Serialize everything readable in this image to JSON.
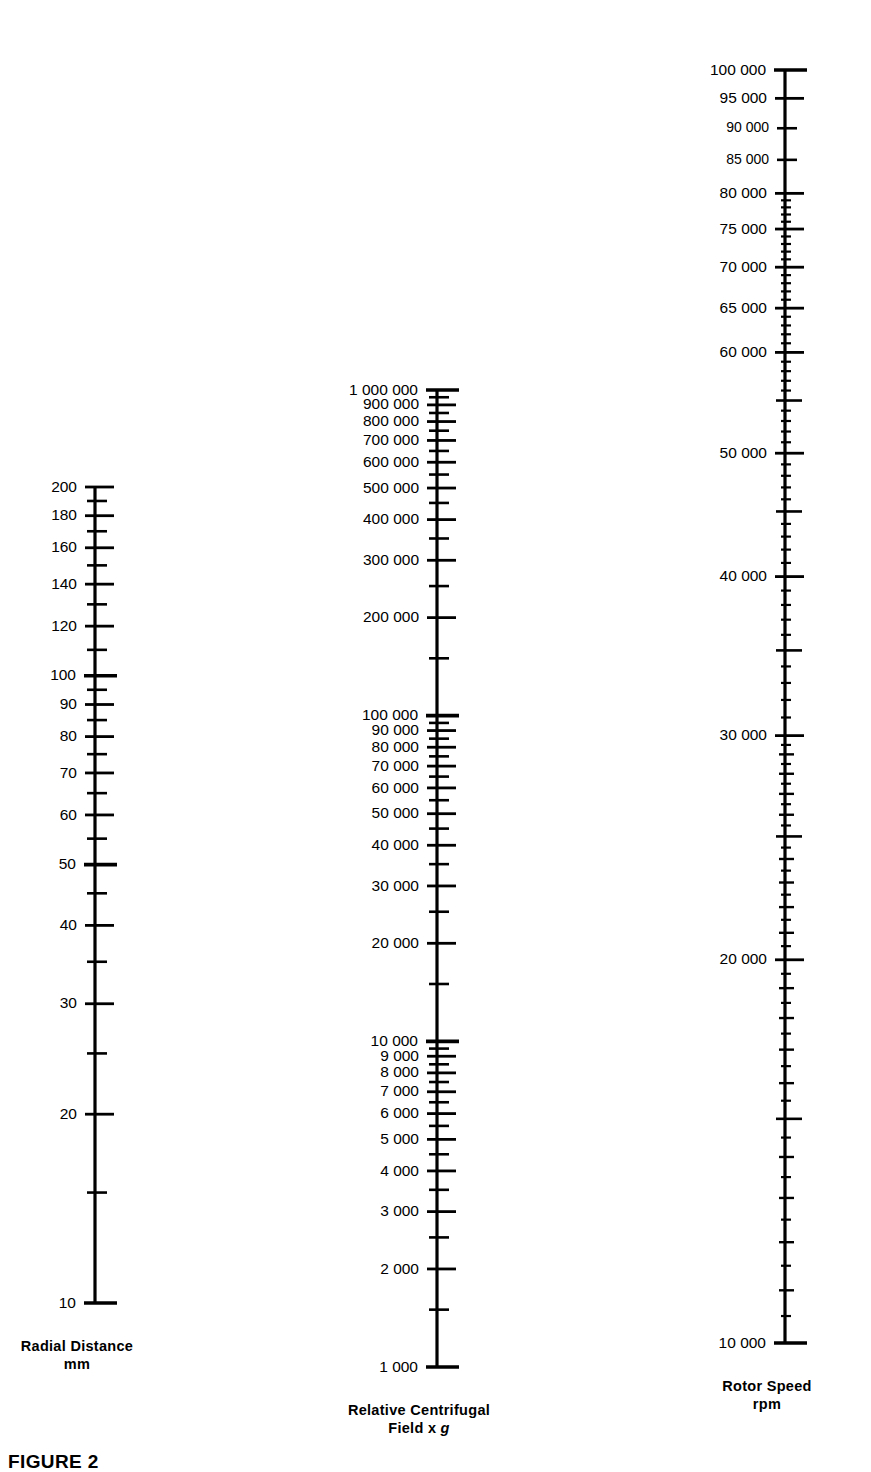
{
  "figure": {
    "caption": "FIGURE 2",
    "background": "#ffffff",
    "ink": "#000000"
  },
  "chart_data": {
    "type": "nomogram",
    "title": "",
    "grid": false,
    "legend": null,
    "axes": [
      {
        "id": "radial-distance",
        "title_line1": "Radial Distance",
        "title_line2": "mm",
        "unit": "mm",
        "scale": "log",
        "range": [
          10,
          200
        ],
        "x": 95,
        "y_top": 487,
        "y_bottom": 1303,
        "labels_side": "left",
        "ticks": [
          {
            "v": 200,
            "label": "200",
            "size": "major"
          },
          {
            "v": 190,
            "label": "",
            "size": "minor"
          },
          {
            "v": 180,
            "label": "180",
            "size": "major"
          },
          {
            "v": 170,
            "label": "",
            "size": "minor"
          },
          {
            "v": 160,
            "label": "160",
            "size": "major"
          },
          {
            "v": 150,
            "label": "",
            "size": "minor"
          },
          {
            "v": 140,
            "label": "140",
            "size": "major"
          },
          {
            "v": 130,
            "label": "",
            "size": "minor"
          },
          {
            "v": 120,
            "label": "120",
            "size": "major"
          },
          {
            "v": 110,
            "label": "",
            "size": "minor"
          },
          {
            "v": 100,
            "label": "100",
            "size": "decade"
          },
          {
            "v": 95,
            "label": "",
            "size": "minor"
          },
          {
            "v": 90,
            "label": "90",
            "size": "major"
          },
          {
            "v": 85,
            "label": "",
            "size": "minor"
          },
          {
            "v": 80,
            "label": "80",
            "size": "major"
          },
          {
            "v": 75,
            "label": "",
            "size": "minor"
          },
          {
            "v": 70,
            "label": "70",
            "size": "major"
          },
          {
            "v": 65,
            "label": "",
            "size": "minor"
          },
          {
            "v": 60,
            "label": "60",
            "size": "major"
          },
          {
            "v": 55,
            "label": "",
            "size": "minor"
          },
          {
            "v": 50,
            "label": "50",
            "size": "decade"
          },
          {
            "v": 45,
            "label": "",
            "size": "minor"
          },
          {
            "v": 40,
            "label": "40",
            "size": "major"
          },
          {
            "v": 35,
            "label": "",
            "size": "minor"
          },
          {
            "v": 30,
            "label": "30",
            "size": "major"
          },
          {
            "v": 25,
            "label": "",
            "size": "minor"
          },
          {
            "v": 20,
            "label": "20",
            "size": "major"
          },
          {
            "v": 15,
            "label": "",
            "size": "minor"
          },
          {
            "v": 10,
            "label": "10",
            "size": "decade"
          }
        ]
      },
      {
        "id": "relative-centrifugal-field",
        "title_line1": "Relative Centrifugal",
        "title_line2_pre": "Field x ",
        "title_line2_italic": "g",
        "unit": "x g",
        "scale": "log",
        "range": [
          1000,
          1000000
        ],
        "x": 437,
        "y_top": 390,
        "y_bottom": 1367,
        "labels_side": "left",
        "ticks": [
          {
            "v": 1000000,
            "label": "1 000 000",
            "size": "decade"
          },
          {
            "v": 950000,
            "label": "",
            "size": "minor"
          },
          {
            "v": 900000,
            "label": "900 000",
            "size": "major"
          },
          {
            "v": 850000,
            "label": "",
            "size": "minor"
          },
          {
            "v": 800000,
            "label": "800 000",
            "size": "major"
          },
          {
            "v": 750000,
            "label": "",
            "size": "minor"
          },
          {
            "v": 700000,
            "label": "700 000",
            "size": "major"
          },
          {
            "v": 650000,
            "label": "",
            "size": "minor"
          },
          {
            "v": 600000,
            "label": "600 000",
            "size": "major"
          },
          {
            "v": 550000,
            "label": "",
            "size": "minor"
          },
          {
            "v": 500000,
            "label": "500 000",
            "size": "major"
          },
          {
            "v": 450000,
            "label": "",
            "size": "minor"
          },
          {
            "v": 400000,
            "label": "400 000",
            "size": "major"
          },
          {
            "v": 350000,
            "label": "",
            "size": "minor"
          },
          {
            "v": 300000,
            "label": "300 000",
            "size": "major"
          },
          {
            "v": 250000,
            "label": "",
            "size": "minor"
          },
          {
            "v": 200000,
            "label": "200 000",
            "size": "major"
          },
          {
            "v": 150000,
            "label": "",
            "size": "minor"
          },
          {
            "v": 100000,
            "label": "100 000",
            "size": "decade"
          },
          {
            "v": 95000,
            "label": "",
            "size": "minor"
          },
          {
            "v": 90000,
            "label": "90 000",
            "size": "major"
          },
          {
            "v": 85000,
            "label": "",
            "size": "minor"
          },
          {
            "v": 80000,
            "label": "80 000",
            "size": "major"
          },
          {
            "v": 75000,
            "label": "",
            "size": "minor"
          },
          {
            "v": 70000,
            "label": "70 000",
            "size": "major"
          },
          {
            "v": 65000,
            "label": "",
            "size": "minor"
          },
          {
            "v": 60000,
            "label": "60 000",
            "size": "major"
          },
          {
            "v": 55000,
            "label": "",
            "size": "minor"
          },
          {
            "v": 50000,
            "label": "50 000",
            "size": "major"
          },
          {
            "v": 45000,
            "label": "",
            "size": "minor"
          },
          {
            "v": 40000,
            "label": "40 000",
            "size": "major"
          },
          {
            "v": 35000,
            "label": "",
            "size": "minor"
          },
          {
            "v": 30000,
            "label": "30 000",
            "size": "major"
          },
          {
            "v": 25000,
            "label": "",
            "size": "minor"
          },
          {
            "v": 20000,
            "label": "20 000",
            "size": "major"
          },
          {
            "v": 15000,
            "label": "",
            "size": "minor"
          },
          {
            "v": 10000,
            "label": "10 000",
            "size": "decade"
          },
          {
            "v": 9500,
            "label": "",
            "size": "minor"
          },
          {
            "v": 9000,
            "label": "9 000",
            "size": "major"
          },
          {
            "v": 8500,
            "label": "",
            "size": "minor"
          },
          {
            "v": 8000,
            "label": "8 000",
            "size": "major"
          },
          {
            "v": 7500,
            "label": "",
            "size": "minor"
          },
          {
            "v": 7000,
            "label": "7 000",
            "size": "major"
          },
          {
            "v": 6500,
            "label": "",
            "size": "minor"
          },
          {
            "v": 6000,
            "label": "6 000",
            "size": "major"
          },
          {
            "v": 5500,
            "label": "",
            "size": "minor"
          },
          {
            "v": 5000,
            "label": "5 000",
            "size": "major"
          },
          {
            "v": 4500,
            "label": "",
            "size": "minor"
          },
          {
            "v": 4000,
            "label": "4 000",
            "size": "major"
          },
          {
            "v": 3500,
            "label": "",
            "size": "minor"
          },
          {
            "v": 3000,
            "label": "3 000",
            "size": "major"
          },
          {
            "v": 2500,
            "label": "",
            "size": "minor"
          },
          {
            "v": 2000,
            "label": "2 000",
            "size": "major"
          },
          {
            "v": 1500,
            "label": "",
            "size": "minor"
          },
          {
            "v": 1000,
            "label": "1 000",
            "size": "decade"
          }
        ]
      },
      {
        "id": "rotor-speed",
        "title_line1": "Rotor Speed",
        "title_line2": "rpm",
        "unit": "rpm",
        "scale": "log",
        "range": [
          10000,
          100000
        ],
        "x": 785,
        "y_top": 70,
        "y_bottom": 1343,
        "labels_side": "left",
        "ticks": [
          {
            "v": 100000,
            "label": "100 000",
            "size": "decade"
          },
          {
            "v": 95000,
            "label": "95 000",
            "size": "major"
          },
          {
            "v": 90000,
            "label": "90 000",
            "size": "minor"
          },
          {
            "v": 85000,
            "label": "85 000",
            "size": "minor"
          },
          {
            "v": 80000,
            "label": "80 000",
            "size": "major"
          },
          {
            "v": 79000,
            "label": "",
            "size": "tiny"
          },
          {
            "v": 78000,
            "label": "",
            "size": "tiny"
          },
          {
            "v": 77000,
            "label": "",
            "size": "tiny"
          },
          {
            "v": 76000,
            "label": "",
            "size": "tiny"
          },
          {
            "v": 75000,
            "label": "75 000",
            "size": "major"
          },
          {
            "v": 74000,
            "label": "",
            "size": "tiny"
          },
          {
            "v": 73000,
            "label": "",
            "size": "tiny"
          },
          {
            "v": 72000,
            "label": "",
            "size": "tiny"
          },
          {
            "v": 71000,
            "label": "",
            "size": "tiny"
          },
          {
            "v": 70000,
            "label": "70 000",
            "size": "major"
          },
          {
            "v": 69000,
            "label": "",
            "size": "tiny"
          },
          {
            "v": 68000,
            "label": "",
            "size": "tiny"
          },
          {
            "v": 67000,
            "label": "",
            "size": "tiny"
          },
          {
            "v": 66000,
            "label": "",
            "size": "tiny"
          },
          {
            "v": 65000,
            "label": "65 000",
            "size": "major"
          },
          {
            "v": 64000,
            "label": "",
            "size": "tiny"
          },
          {
            "v": 63000,
            "label": "",
            "size": "tiny"
          },
          {
            "v": 62000,
            "label": "",
            "size": "tiny"
          },
          {
            "v": 61000,
            "label": "",
            "size": "tiny"
          },
          {
            "v": 60000,
            "label": "60 000",
            "size": "major"
          },
          {
            "v": 59000,
            "label": "",
            "size": "tiny"
          },
          {
            "v": 58000,
            "label": "",
            "size": "tiny"
          },
          {
            "v": 57000,
            "label": "",
            "size": "tiny"
          },
          {
            "v": 56000,
            "label": "",
            "size": "tiny"
          },
          {
            "v": 55000,
            "label": "",
            "size": "medium"
          },
          {
            "v": 54000,
            "label": "",
            "size": "tiny"
          },
          {
            "v": 53000,
            "label": "",
            "size": "tiny"
          },
          {
            "v": 52000,
            "label": "",
            "size": "tiny"
          },
          {
            "v": 51000,
            "label": "",
            "size": "tiny"
          },
          {
            "v": 50000,
            "label": "50 000",
            "size": "major"
          },
          {
            "v": 49000,
            "label": "",
            "size": "tiny"
          },
          {
            "v": 48000,
            "label": "",
            "size": "tiny"
          },
          {
            "v": 47000,
            "label": "",
            "size": "tiny"
          },
          {
            "v": 46000,
            "label": "",
            "size": "tiny"
          },
          {
            "v": 45000,
            "label": "",
            "size": "medium"
          },
          {
            "v": 44000,
            "label": "",
            "size": "tiny"
          },
          {
            "v": 43000,
            "label": "",
            "size": "tiny"
          },
          {
            "v": 42000,
            "label": "",
            "size": "tiny"
          },
          {
            "v": 41000,
            "label": "",
            "size": "tiny"
          },
          {
            "v": 40000,
            "label": "40 000",
            "size": "major"
          },
          {
            "v": 39000,
            "label": "",
            "size": "tiny"
          },
          {
            "v": 38000,
            "label": "",
            "size": "tiny"
          },
          {
            "v": 37000,
            "label": "",
            "size": "tiny"
          },
          {
            "v": 36000,
            "label": "",
            "size": "tiny"
          },
          {
            "v": 35000,
            "label": "",
            "size": "medium"
          },
          {
            "v": 34000,
            "label": "",
            "size": "tiny"
          },
          {
            "v": 33000,
            "label": "",
            "size": "tiny"
          },
          {
            "v": 32000,
            "label": "",
            "size": "tiny"
          },
          {
            "v": 31000,
            "label": "",
            "size": "tiny"
          },
          {
            "v": 30000,
            "label": "30 000",
            "size": "major"
          },
          {
            "v": 29500,
            "label": "",
            "size": "tiny"
          },
          {
            "v": 29000,
            "label": "",
            "size": "small"
          },
          {
            "v": 28500,
            "label": "",
            "size": "tiny"
          },
          {
            "v": 28000,
            "label": "",
            "size": "small"
          },
          {
            "v": 27500,
            "label": "",
            "size": "tiny"
          },
          {
            "v": 27000,
            "label": "",
            "size": "small"
          },
          {
            "v": 26500,
            "label": "",
            "size": "tiny"
          },
          {
            "v": 26000,
            "label": "",
            "size": "small"
          },
          {
            "v": 25500,
            "label": "",
            "size": "tiny"
          },
          {
            "v": 25000,
            "label": "",
            "size": "medium"
          },
          {
            "v": 24500,
            "label": "",
            "size": "tiny"
          },
          {
            "v": 24000,
            "label": "",
            "size": "small"
          },
          {
            "v": 23500,
            "label": "",
            "size": "tiny"
          },
          {
            "v": 23000,
            "label": "",
            "size": "small"
          },
          {
            "v": 22500,
            "label": "",
            "size": "tiny"
          },
          {
            "v": 22000,
            "label": "",
            "size": "small"
          },
          {
            "v": 21500,
            "label": "",
            "size": "tiny"
          },
          {
            "v": 21000,
            "label": "",
            "size": "small"
          },
          {
            "v": 20500,
            "label": "",
            "size": "tiny"
          },
          {
            "v": 20000,
            "label": "20 000",
            "size": "major"
          },
          {
            "v": 19500,
            "label": "",
            "size": "tiny"
          },
          {
            "v": 19000,
            "label": "",
            "size": "small"
          },
          {
            "v": 18500,
            "label": "",
            "size": "tiny"
          },
          {
            "v": 18000,
            "label": "",
            "size": "small"
          },
          {
            "v": 17500,
            "label": "",
            "size": "tiny"
          },
          {
            "v": 17000,
            "label": "",
            "size": "small"
          },
          {
            "v": 16500,
            "label": "",
            "size": "tiny"
          },
          {
            "v": 16000,
            "label": "",
            "size": "small"
          },
          {
            "v": 15500,
            "label": "",
            "size": "tiny"
          },
          {
            "v": 15000,
            "label": "",
            "size": "medium"
          },
          {
            "v": 14500,
            "label": "",
            "size": "tiny"
          },
          {
            "v": 14000,
            "label": "",
            "size": "small"
          },
          {
            "v": 13500,
            "label": "",
            "size": "tiny"
          },
          {
            "v": 13000,
            "label": "",
            "size": "small"
          },
          {
            "v": 12500,
            "label": "",
            "size": "tiny"
          },
          {
            "v": 12000,
            "label": "",
            "size": "small"
          },
          {
            "v": 11500,
            "label": "",
            "size": "tiny"
          },
          {
            "v": 11000,
            "label": "",
            "size": "small"
          },
          {
            "v": 10500,
            "label": "",
            "size": "tiny"
          },
          {
            "v": 10000,
            "label": "10 000",
            "size": "decade"
          }
        ]
      }
    ]
  }
}
